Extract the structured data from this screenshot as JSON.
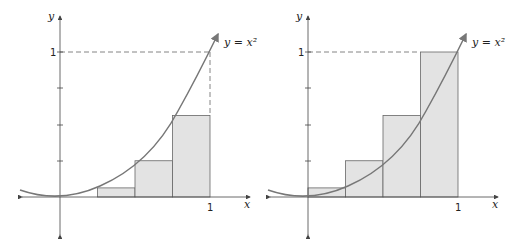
{
  "panels": [
    {
      "id": "left",
      "description": "Left-endpoint Riemann sum (inscribed rectangles)",
      "curve_label": "y = x²",
      "axis_x_label": "x",
      "axis_y_label": "y",
      "tick_x": "1",
      "tick_y": "1",
      "rect_heights": [
        0,
        0.0625,
        0.25,
        0.5625
      ]
    },
    {
      "id": "right",
      "description": "Right-endpoint Riemann sum (circumscribed rectangles)",
      "curve_label": "y = x²",
      "axis_x_label": "x",
      "axis_y_label": "y",
      "tick_x": "1",
      "tick_y": "1",
      "rect_heights": [
        0.0625,
        0.25,
        0.5625,
        1
      ]
    }
  ],
  "colors": {
    "curve": "#777777",
    "rect_fill": "#e3e3e3",
    "rect_stroke": "#666666",
    "axis": "#444444"
  }
}
